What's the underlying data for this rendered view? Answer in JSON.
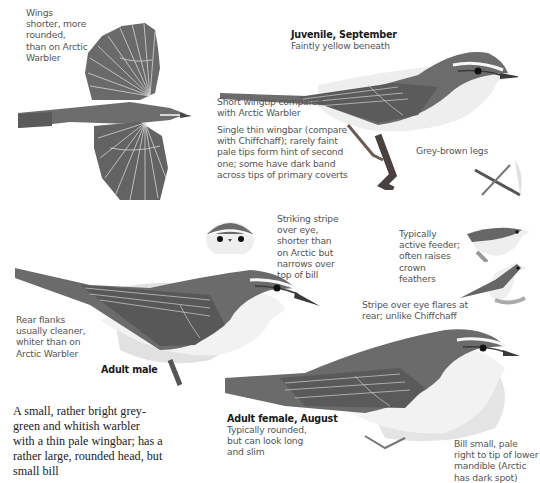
{
  "page": {
    "intro": "A small, rather bright grey-green and whitish warbler with a thin pale wingbar; has a rather large, rounded head, but small bill",
    "figures": [
      {
        "id": "flight",
        "caption": "Wings shorter, more rounded, than on Arctic Warbler"
      },
      {
        "id": "juvenile",
        "title": "Juvenile, September",
        "caption": "Faintly yellow beneath"
      },
      {
        "id": "adult-male",
        "title": "Adult male"
      },
      {
        "id": "adult-female",
        "title": "Adult female, August",
        "caption": "Typically rounded, but can look long and slim"
      },
      {
        "id": "head-front"
      },
      {
        "id": "legs"
      },
      {
        "id": "feeding-1"
      },
      {
        "id": "feeding-2"
      }
    ],
    "annotations": {
      "wingtip": "Short wingtip compared with Arctic Warbler",
      "wingbar": "Single thin wingbar (compare with Chiffchaff); rarely faint pale tips form hint of second one; some have dark band across tips of primary coverts",
      "legs": "Grey-brown legs",
      "eye_stripe": "Striking stripe over eye, shorter than on Arctic but narrows over top of bill",
      "active_feeder": "Typically active feeder; often raises crown feathers",
      "stripe_flares": "Stripe over eye flares at rear; unlike Chiffchaff",
      "flanks": "Rear flanks usually cleaner, whiter than on Arctic Warbler",
      "bill": "Bill small, pale right to tip of lower mandible (Arctic has dark spot)"
    },
    "colors": {
      "upperparts": "#6f6f6f",
      "wing": "#5a5a5a",
      "underparts": "#f2f2f2",
      "shadow": "#d8d8d8",
      "text": "#555555",
      "title": "#1a1a1a"
    }
  }
}
